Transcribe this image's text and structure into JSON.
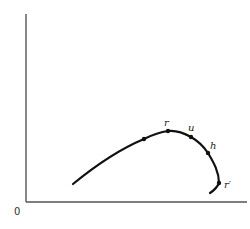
{
  "diagram": {
    "origin_label": "0",
    "points": [
      {
        "id": "unlabeled",
        "label": "",
        "x": 144,
        "y": 139
      },
      {
        "id": "r",
        "label": "r",
        "x": 168,
        "y": 131
      },
      {
        "id": "u",
        "label": "u",
        "x": 191,
        "y": 137
      },
      {
        "id": "h",
        "label": "h",
        "x": 208,
        "y": 153
      },
      {
        "id": "r-prime",
        "label": "r′",
        "x": 219,
        "y": 183
      }
    ],
    "labels": {
      "r": "r",
      "u": "u",
      "h": "h",
      "r_prime": "r′"
    },
    "colors": {
      "curve": "#111111",
      "axis": "#555555",
      "background": "#ffffff"
    }
  }
}
